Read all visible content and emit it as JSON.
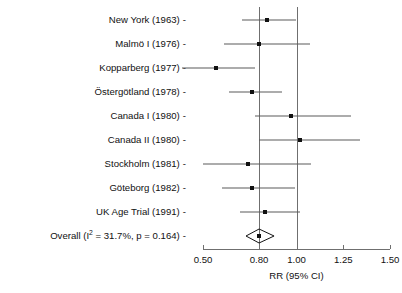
{
  "chart_data": {
    "type": "forest",
    "title": "",
    "subtitle": "",
    "xlabel": "RR (95% CI)",
    "ylabel": "",
    "xlim": [
      0.5,
      1.5
    ],
    "xticks": [
      0.5,
      0.8,
      1.0,
      1.25,
      1.5
    ],
    "xticklabels": [
      "0.50",
      "0.80",
      "1.00",
      "1.25",
      "1.50"
    ],
    "xscale": "linear",
    "grid": false,
    "legend": null,
    "reference_lines": [
      {
        "name": "null-line",
        "value": 1.0
      },
      {
        "name": "pooled-effect-line",
        "value": 0.8
      }
    ],
    "effect_measure": "RR",
    "categories": [
      "New York (1963)",
      "Malmö I (1976)",
      "Kopparberg (1977)",
      "Östergötland (1978)",
      "Canada I (1980)",
      "Canada II (1980)",
      "Stockholm (1981)",
      "Göteborg (1982)",
      "UK Age Trial (1991)",
      "Overall (I² = 31.7%, p = 0.164)"
    ],
    "studies": [
      {
        "label": "New York (1963)",
        "rr": 0.84,
        "ci_low": 0.71,
        "ci_high": 1.0
      },
      {
        "label": "Malmö I (1976)",
        "rr": 0.8,
        "ci_low": 0.61,
        "ci_high": 1.07
      },
      {
        "label": "Kopparberg (1977)",
        "rr": 0.57,
        "ci_low": 0.39,
        "ci_high": 0.78
      },
      {
        "label": "Östergötland (1978)",
        "rr": 0.76,
        "ci_low": 0.64,
        "ci_high": 0.92
      },
      {
        "label": "Canada I (1980)",
        "rr": 0.97,
        "ci_low": 0.78,
        "ci_high": 1.29
      },
      {
        "label": "Canada II (1980)",
        "rr": 1.02,
        "ci_low": 0.8,
        "ci_high": 1.34
      },
      {
        "label": "Stockholm (1981)",
        "rr": 0.74,
        "ci_low": 0.5,
        "ci_high": 1.08
      },
      {
        "label": "Göteborg (1982)",
        "rr": 0.76,
        "ci_low": 0.6,
        "ci_high": 0.99
      },
      {
        "label": "UK Age Trial (1991)",
        "rr": 0.83,
        "ci_low": 0.7,
        "ci_high": 1.02
      }
    ],
    "overall": {
      "label_prefix": "Overall (I",
      "label_sup": "2",
      "label_suffix": " = 31.7%, p = 0.164)",
      "label": "Overall (I² = 31.7%, p = 0.164)",
      "rr": 0.8,
      "ci_low": 0.73,
      "ci_high": 0.88,
      "i_squared": "31.7%",
      "p_value": "0.164"
    },
    "tick_dash": "-",
    "colors": {
      "marker": "#111111",
      "ci_line": "#5a5a5a",
      "reference_line": "#6f6f6f",
      "axis": "#6f6f6f",
      "text": "#111111",
      "background": "#ffffff"
    }
  },
  "layout": {
    "plot_left_px": 203,
    "plot_right_px": 390,
    "row_top_px": 20,
    "row_step_px": 24,
    "axis_y_px": 249
  }
}
